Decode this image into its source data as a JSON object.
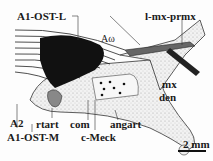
{
  "figure": {
    "labels": {
      "a1_ost_l": "A1-OST-L",
      "l_mx_prmx": "l-mx-prmx",
      "a_omega": "Aω",
      "mx": "mx",
      "den": "den",
      "a2": "A2",
      "rtart": "rtart",
      "com": "com",
      "angart": "angart",
      "a1_ost_m": "A1-OST-M",
      "c_meck": "c-Meck"
    },
    "scale_bar": {
      "label": "2 mm"
    },
    "colors": {
      "ink": "#1a1a1a",
      "stipple": "#d8d8d8",
      "background": "#fdfdfd"
    }
  }
}
